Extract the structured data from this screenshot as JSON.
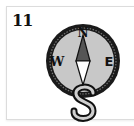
{
  "card": {
    "number": "11",
    "icon": "compass-icon",
    "compass": {
      "north": "N",
      "east": "E",
      "west": "W",
      "south": "S"
    }
  },
  "colors": {
    "ring": "#1a1a1a",
    "face": "#c8c8c8",
    "needle_dark": "#555555",
    "needle_light": "#ffffff",
    "card_border": "#dcdcdc"
  }
}
